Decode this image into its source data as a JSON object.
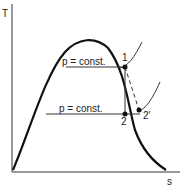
{
  "diagram": {
    "type": "T-s diagram",
    "axes": {
      "y_label": "T",
      "x_label": "s"
    },
    "isobars": [
      {
        "label": "p = const.",
        "level": "upper"
      },
      {
        "label": "p = const.",
        "level": "lower"
      }
    ],
    "points": [
      {
        "label": "1"
      },
      {
        "label": "2"
      },
      {
        "label": "2′"
      }
    ],
    "colors": {
      "line": "#111111",
      "background": "#ffffff"
    }
  }
}
